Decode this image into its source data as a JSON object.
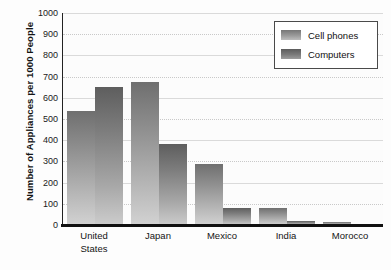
{
  "chart_data": {
    "type": "bar",
    "title": "",
    "xlabel": "",
    "ylabel": "Number of Appliances per 1000 People",
    "ylim": [
      0,
      1000
    ],
    "ytick_step": 100,
    "yticks": [
      "1000",
      "900",
      "800",
      "700",
      "600",
      "500",
      "400",
      "300",
      "200",
      "100",
      "0"
    ],
    "categories": [
      "United States",
      "Japan",
      "Mexico",
      "India",
      "Morocco"
    ],
    "category_lines": [
      [
        "United",
        "States"
      ],
      [
        "Japan"
      ],
      [
        "Mexico"
      ],
      [
        "India"
      ],
      [
        "Morocco"
      ]
    ],
    "grid": true,
    "legend_position": "top-right",
    "series": [
      {
        "name": "Cell phones",
        "color": "#8c8c8c",
        "values": [
          540,
          675,
          290,
          80,
          15
        ]
      },
      {
        "name": "Computers",
        "color": "#6e6e6e",
        "values": [
          650,
          380,
          80,
          20,
          3
        ]
      }
    ]
  },
  "legend": {
    "items": [
      {
        "label": "Cell phones",
        "swatch": "cell"
      },
      {
        "label": "Computers",
        "swatch": "comp"
      }
    ]
  },
  "colors": {
    "bar_dark": "#5e5e5e",
    "bar_light": "#d2d2d2",
    "axis": "#111111",
    "gridline": "#c9c9c9",
    "background": "#fdfdfd",
    "text": "#141414"
  }
}
